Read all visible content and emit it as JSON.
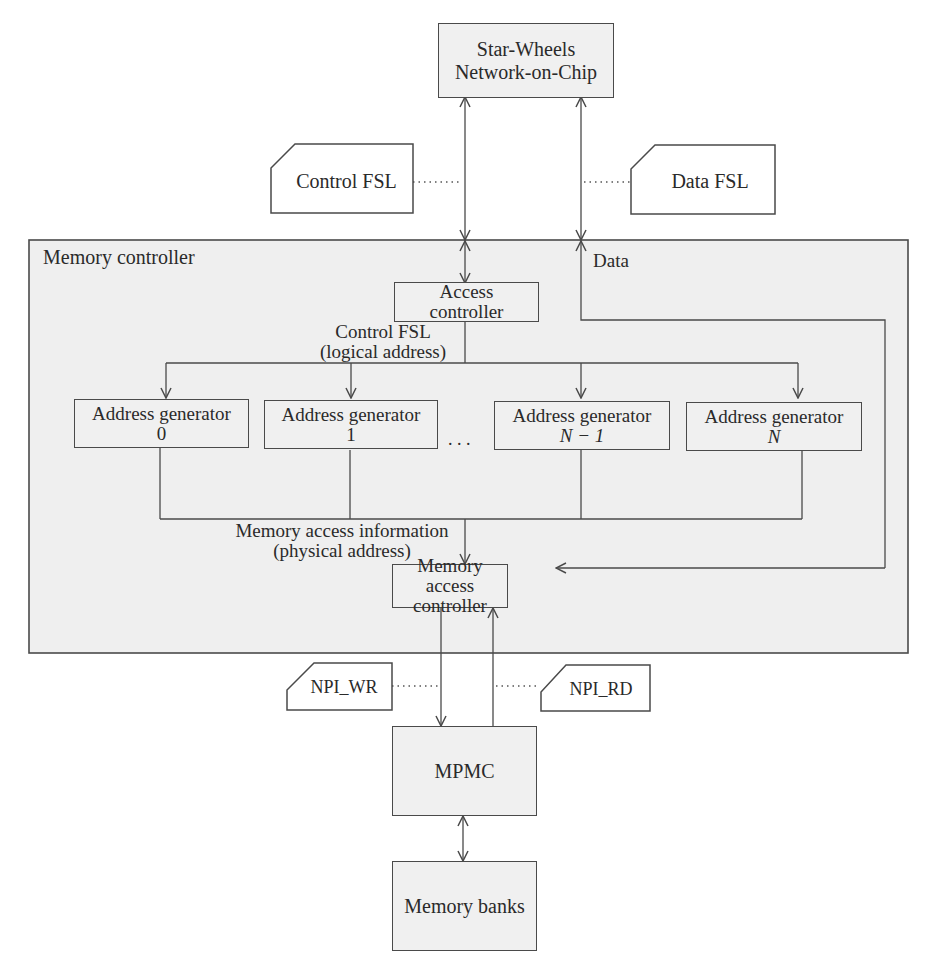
{
  "diagram": {
    "noc": {
      "line1": "Star-Wheels",
      "line2": "Network-on-Chip"
    },
    "fsl_tags": {
      "control_fsl": "Control FSL",
      "data_fsl": "Data FSL",
      "npi_wr": "NPI_WR",
      "npi_rd": "NPI_RD"
    },
    "memory_controller": {
      "title": "Memory controller",
      "data_label": "Data",
      "access_controller": {
        "line1": "Access",
        "line2": "controller"
      },
      "control_label": {
        "line1": "Control FSL",
        "line2": "(logical address)"
      },
      "address_generators": [
        {
          "label": "Address generator",
          "index": "0"
        },
        {
          "label": "Address generator",
          "index": "1"
        },
        {
          "label": "Address generator",
          "index": "N − 1"
        },
        {
          "label": "Address generator",
          "index": "N"
        }
      ],
      "ellipsis": ". . .",
      "mem_info_label": {
        "line1": "Memory access information",
        "line2": "(physical address)"
      },
      "memory_access_controller": {
        "line1": "Memory access",
        "line2": "controller"
      }
    },
    "mpmc": "MPMC",
    "memory_banks": "Memory banks"
  },
  "colors": {
    "stroke": "#4a4a4a",
    "box_fill": "#f0f0f0",
    "region_fill": "#efefef",
    "text": "#2a2a2a"
  }
}
